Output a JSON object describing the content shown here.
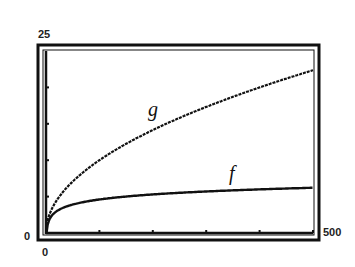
{
  "chart_data": {
    "type": "line",
    "title": "",
    "xlabel": "",
    "ylabel": "",
    "xlim": [
      0,
      500
    ],
    "ylim": [
      0,
      25
    ],
    "x_tick_labels": {
      "min": "0",
      "max": "500"
    },
    "y_tick_labels": {
      "min": "0",
      "max": "25"
    },
    "x_ticks": [
      100,
      200,
      300,
      400,
      500
    ],
    "y_ticks": [
      5,
      10,
      15,
      20
    ],
    "grid": false,
    "legend": "none (inline curve labels)",
    "series": [
      {
        "name": "g",
        "function": "sqrt(x)",
        "label_position": {
          "x": 200,
          "y": 16.5
        },
        "x": [
          0,
          10,
          25,
          50,
          100,
          150,
          200,
          250,
          300,
          350,
          400,
          450,
          500
        ],
        "values": [
          0,
          3.16,
          5.0,
          7.07,
          10.0,
          12.25,
          14.14,
          15.81,
          17.32,
          18.71,
          20.0,
          21.21,
          22.36
        ]
      },
      {
        "name": "f",
        "function": "ln(x)",
        "label_position": {
          "x": 355,
          "y": 7.5
        },
        "x": [
          1,
          10,
          25,
          50,
          100,
          150,
          200,
          250,
          300,
          350,
          400,
          450,
          500
        ],
        "values": [
          0,
          2.3,
          3.22,
          3.91,
          4.61,
          5.01,
          5.3,
          5.52,
          5.7,
          5.86,
          5.99,
          6.11,
          6.21
        ]
      }
    ]
  }
}
